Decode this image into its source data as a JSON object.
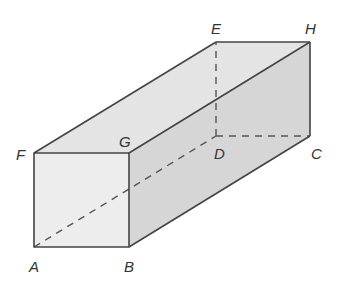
{
  "diagram": {
    "type": "cuboid",
    "colors": {
      "front_face": "#ededed",
      "top_face": "#e4e4e4",
      "right_face": "#d6d6d6",
      "edge": "#444444",
      "hidden_edge": "#555555",
      "label": "#333333"
    },
    "vertices": {
      "A": {
        "label": "A",
        "x": 34,
        "y": 247
      },
      "B": {
        "label": "B",
        "x": 129,
        "y": 247
      },
      "C": {
        "label": "C",
        "x": 310,
        "y": 136
      },
      "D": {
        "label": "D",
        "x": 216,
        "y": 136
      },
      "E": {
        "label": "E",
        "x": 216,
        "y": 42
      },
      "F": {
        "label": "F",
        "x": 34,
        "y": 153
      },
      "G": {
        "label": "G",
        "x": 129,
        "y": 153
      },
      "H": {
        "label": "H",
        "x": 310,
        "y": 42
      }
    },
    "visible_edges": [
      "AB",
      "BG",
      "GF",
      "FA",
      "FE",
      "EH",
      "GH",
      "HC",
      "BC"
    ],
    "hidden_edges": [
      "AD",
      "DE",
      "DC"
    ]
  }
}
